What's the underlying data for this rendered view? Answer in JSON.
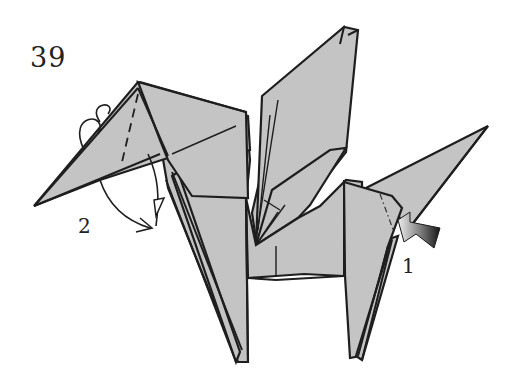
{
  "diagram": {
    "type": "origami-instruction-step",
    "step_number": "39",
    "labels": [
      {
        "id": "1",
        "text": "1",
        "target": "tail",
        "action": "inside reverse fold (push arrow)"
      },
      {
        "id": "2",
        "text": "2",
        "target": "head",
        "action": "crimp / outside reverse fold (dashed valley line, curved arrows)"
      }
    ],
    "colors": {
      "paper": "#c4c4c4",
      "line": "#1e1e1e",
      "background": "#ffffff",
      "push_arrow_dark": "#1a1a1a",
      "push_arrow_light": "#e8e8e8"
    },
    "parts": [
      "head-neck",
      "wings",
      "body",
      "front-legs",
      "hind-legs",
      "tail"
    ]
  }
}
